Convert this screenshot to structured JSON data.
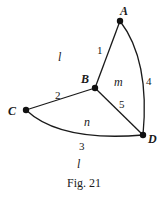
{
  "figure": {
    "caption": "Fig. 21",
    "vertices": [
      {
        "id": "A",
        "label": "A"
      },
      {
        "id": "B",
        "label": "B"
      },
      {
        "id": "C",
        "label": "C"
      },
      {
        "id": "D",
        "label": "D"
      }
    ],
    "edges": [
      {
        "id": "1",
        "label": "1",
        "from": "B",
        "to": "A",
        "shape": "straight"
      },
      {
        "id": "2",
        "label": "2",
        "from": "C",
        "to": "B",
        "shape": "straight"
      },
      {
        "id": "3",
        "label": "3",
        "from": "C",
        "to": "D",
        "shape": "curved"
      },
      {
        "id": "4",
        "label": "4",
        "from": "A",
        "to": "D",
        "shape": "curved"
      },
      {
        "id": "5",
        "label": "5",
        "from": "B",
        "to": "D",
        "shape": "straight"
      }
    ],
    "faces": [
      {
        "id": "l-top",
        "label": "l"
      },
      {
        "id": "m",
        "label": "m"
      },
      {
        "id": "n",
        "label": "n"
      },
      {
        "id": "l-bottom",
        "label": "l"
      }
    ]
  }
}
